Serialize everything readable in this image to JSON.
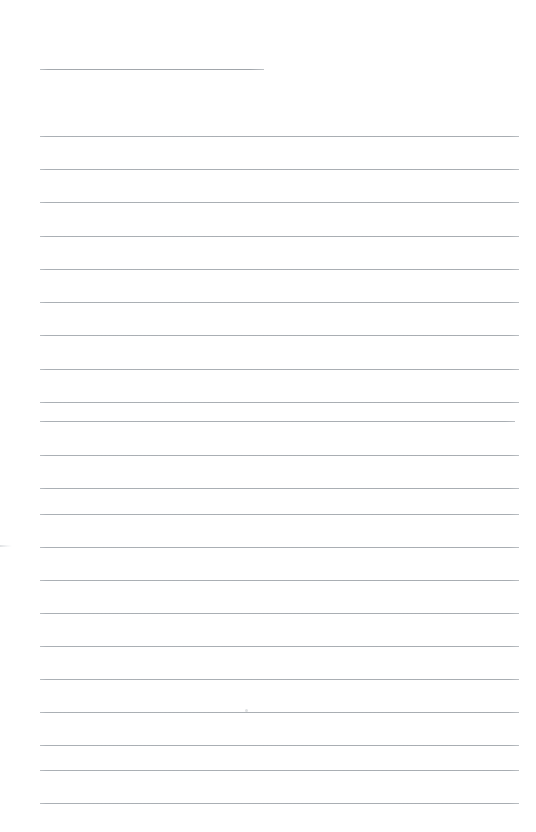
{
  "document": {
    "kind": "scanned-lined-paper",
    "page_label": "",
    "background_color": "#ffffff",
    "width_px": 536,
    "height_px": 832,
    "written_text": "",
    "notes_content": ""
  },
  "ruling": {
    "line_color": "#b9bdc1",
    "heading_line_color": "#a4a9ae",
    "line_thickness_px": 1,
    "line_spacing_px": 33.3,
    "left_margin_px": 40,
    "right_margin_px": 519,
    "body_line_count": 21,
    "first_body_line_y_px": 136
  },
  "heading_rule": {
    "label": "heading-rule",
    "x_px": 40,
    "y_px": 69,
    "width_px": 224
  },
  "body_lines": [
    {
      "label": "ruled-line-1",
      "y_px": 136,
      "x_px": 40,
      "width_px": 479
    },
    {
      "label": "ruled-line-2",
      "y_px": 169,
      "x_px": 40,
      "width_px": 479
    },
    {
      "label": "ruled-line-3",
      "y_px": 202,
      "x_px": 40,
      "width_px": 479
    },
    {
      "label": "ruled-line-4",
      "y_px": 236,
      "x_px": 40,
      "width_px": 479
    },
    {
      "label": "ruled-line-5",
      "y_px": 269,
      "x_px": 40,
      "width_px": 479
    },
    {
      "label": "ruled-line-6",
      "y_px": 302,
      "x_px": 40,
      "width_px": 479
    },
    {
      "label": "ruled-line-7",
      "y_px": 335,
      "x_px": 40,
      "width_px": 479
    },
    {
      "label": "ruled-line-8",
      "y_px": 369,
      "x_px": 40,
      "width_px": 479
    },
    {
      "label": "ruled-line-9",
      "y_px": 402,
      "x_px": 40,
      "width_px": 479
    },
    {
      "label": "ruled-line-10",
      "y_px": 421,
      "x_px": 40,
      "width_px": 475
    },
    {
      "label": "ruled-line-11",
      "y_px": 455,
      "x_px": 40,
      "width_px": 479
    },
    {
      "label": "ruled-line-12",
      "y_px": 488,
      "x_px": 40,
      "width_px": 479
    },
    {
      "label": "ruled-line-13",
      "y_px": 514,
      "x_px": 40,
      "width_px": 479
    },
    {
      "label": "ruled-line-14",
      "y_px": 547,
      "x_px": 40,
      "width_px": 479
    },
    {
      "label": "ruled-line-15",
      "y_px": 580,
      "x_px": 40,
      "width_px": 479
    },
    {
      "label": "ruled-line-16",
      "y_px": 613,
      "x_px": 40,
      "width_px": 479
    },
    {
      "label": "ruled-line-17",
      "y_px": 646,
      "x_px": 40,
      "width_px": 479
    },
    {
      "label": "ruled-line-18",
      "y_px": 679,
      "x_px": 40,
      "width_px": 479
    },
    {
      "label": "ruled-line-19",
      "y_px": 712,
      "x_px": 40,
      "width_px": 479
    },
    {
      "label": "ruled-line-20",
      "y_px": 745,
      "x_px": 40,
      "width_px": 479
    },
    {
      "label": "ruled-line-21",
      "y_px": 770,
      "x_px": 40,
      "width_px": 479
    },
    {
      "label": "ruled-line-22",
      "y_px": 803,
      "x_px": 40,
      "width_px": 479
    }
  ],
  "artifacts": [
    {
      "label": "scan-speck-center",
      "x_px": 245,
      "y_px": 710,
      "size_px": 3
    },
    {
      "label": "scan-smudge-left-edge",
      "x_px": 0,
      "y_px": 545,
      "width_px": 12,
      "height_px": 2
    }
  ]
}
